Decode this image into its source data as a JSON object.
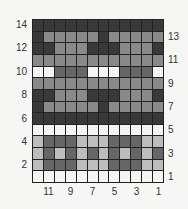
{
  "chart_data": {
    "type": "heatmap",
    "title": "",
    "columns": 12,
    "rows": 14,
    "row_labels_left": [
      "14",
      "12",
      "10",
      "8",
      "6",
      "4",
      "2"
    ],
    "row_labels_right": [
      "13",
      "11",
      "9",
      "7",
      "5",
      "3",
      "1"
    ],
    "column_labels": [
      "11",
      "9",
      "7",
      "5",
      "3",
      "1"
    ],
    "palette": {
      "D": "#393939",
      "G": "#666666",
      "M": "#8a8a8a",
      "L": "#bdbdbd",
      "W": "#f4f4f2"
    },
    "grid_top_to_bottom": [
      {
        "row": 14,
        "cells": [
          "D",
          "D",
          "D",
          "D",
          "D",
          "D",
          "D",
          "D",
          "D",
          "D",
          "D",
          "D"
        ]
      },
      {
        "row": 13,
        "cells": [
          "D",
          "M",
          "M",
          "M",
          "M",
          "M",
          "D",
          "M",
          "M",
          "M",
          "M",
          "M"
        ]
      },
      {
        "row": 12,
        "cells": [
          "D",
          "D",
          "M",
          "M",
          "M",
          "D",
          "D",
          "D",
          "M",
          "M",
          "M",
          "D"
        ]
      },
      {
        "row": 11,
        "cells": [
          "M",
          "M",
          "M",
          "M",
          "M",
          "M",
          "M",
          "M",
          "M",
          "M",
          "M",
          "M"
        ]
      },
      {
        "row": 10,
        "cells": [
          "W",
          "W",
          "G",
          "G",
          "G",
          "W",
          "W",
          "W",
          "G",
          "G",
          "G",
          "W"
        ]
      },
      {
        "row": 9,
        "cells": [
          "M",
          "M",
          "M",
          "M",
          "M",
          "M",
          "M",
          "M",
          "M",
          "M",
          "M",
          "M"
        ]
      },
      {
        "row": 8,
        "cells": [
          "D",
          "D",
          "M",
          "M",
          "M",
          "D",
          "D",
          "D",
          "M",
          "M",
          "M",
          "D"
        ]
      },
      {
        "row": 7,
        "cells": [
          "D",
          "M",
          "M",
          "M",
          "M",
          "M",
          "D",
          "M",
          "M",
          "M",
          "M",
          "M"
        ]
      },
      {
        "row": 6,
        "cells": [
          "D",
          "D",
          "D",
          "D",
          "D",
          "D",
          "D",
          "D",
          "D",
          "D",
          "D",
          "D"
        ]
      },
      {
        "row": 5,
        "cells": [
          "W",
          "W",
          "W",
          "W",
          "W",
          "W",
          "W",
          "W",
          "W",
          "W",
          "W",
          "W"
        ]
      },
      {
        "row": 4,
        "cells": [
          "L",
          "G",
          "G",
          "G",
          "L",
          "L",
          "L",
          "G",
          "G",
          "G",
          "L",
          "L"
        ]
      },
      {
        "row": 3,
        "cells": [
          "L",
          "G",
          "L",
          "G",
          "L",
          "G",
          "L",
          "G",
          "L",
          "G",
          "L",
          "G"
        ]
      },
      {
        "row": 2,
        "cells": [
          "L",
          "G",
          "G",
          "G",
          "L",
          "L",
          "L",
          "G",
          "G",
          "G",
          "L",
          "L"
        ]
      },
      {
        "row": 1,
        "cells": [
          "W",
          "W",
          "W",
          "W",
          "W",
          "W",
          "W",
          "W",
          "W",
          "W",
          "W",
          "W"
        ]
      }
    ],
    "grid": true,
    "legend": null
  }
}
